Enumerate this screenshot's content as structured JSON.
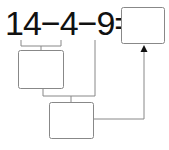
{
  "expression": {
    "text": "14−4−9=",
    "terms": [
      "14",
      "4",
      "9"
    ],
    "operators": [
      "−",
      "−",
      "="
    ]
  },
  "boxes": {
    "answer": "",
    "step1": "",
    "step2": ""
  },
  "colors": {
    "text": "#111111",
    "lines": "#777777"
  }
}
